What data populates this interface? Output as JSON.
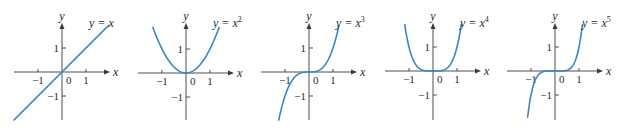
{
  "colors": {
    "curve": "#3d84c6",
    "axis": "#3a3a3a"
  },
  "chart_data": [
    {
      "type": "line",
      "title": "",
      "function": "y = x",
      "exponent": 1,
      "label_base": "y = x",
      "label_sup": "",
      "xlabel": "x",
      "ylabel": "y",
      "x_ticks": [
        "-1",
        "0",
        "1"
      ],
      "y_ticks": [
        "1",
        "-1"
      ],
      "xlim": [
        -2.0,
        2.0
      ],
      "ylim": [
        -2.0,
        2.0
      ],
      "curve_x_range": [
        -2.0,
        1.95
      ],
      "grid": false
    },
    {
      "type": "line",
      "title": "",
      "function": "y = x^2",
      "exponent": 2,
      "label_base": "y = x",
      "label_sup": "2",
      "xlabel": "x",
      "ylabel": "y",
      "x_ticks": [
        "-1",
        "0",
        "1"
      ],
      "y_ticks": [
        "1",
        "-1"
      ],
      "xlim": [
        -1.9,
        1.9
      ],
      "ylim": [
        -2.0,
        2.0
      ],
      "curve_x_range": [
        -1.38,
        1.38
      ],
      "grid": false
    },
    {
      "type": "line",
      "title": "",
      "function": "y = x^3",
      "exponent": 3,
      "label_base": "y = x",
      "label_sup": "3",
      "xlabel": "x",
      "ylabel": "y",
      "x_ticks": [
        "-1",
        "0",
        "1"
      ],
      "y_ticks": [
        "1",
        "-1"
      ],
      "xlim": [
        -1.9,
        1.9
      ],
      "ylim": [
        -2.0,
        2.0
      ],
      "curve_x_range": [
        -1.26,
        1.24
      ],
      "grid": false
    },
    {
      "type": "line",
      "title": "",
      "function": "y = x^4",
      "exponent": 4,
      "label_base": "y = x",
      "label_sup": "4",
      "xlabel": "x",
      "ylabel": "y",
      "x_ticks": [
        "-1",
        "0",
        "1"
      ],
      "y_ticks": [
        "1",
        "-1"
      ],
      "xlim": [
        -1.9,
        1.9
      ],
      "ylim": [
        -2.0,
        2.0
      ],
      "curve_x_range": [
        -1.18,
        1.18
      ],
      "grid": false
    },
    {
      "type": "line",
      "title": "",
      "function": "y = x^5",
      "exponent": 5,
      "label_base": "y = x",
      "label_sup": "5",
      "xlabel": "x",
      "ylabel": "y",
      "x_ticks": [
        "-1",
        "0",
        "1"
      ],
      "y_ticks": [
        "1",
        "-1"
      ],
      "xlim": [
        -1.9,
        1.9
      ],
      "ylim": [
        -2.0,
        2.0
      ],
      "curve_x_range": [
        -1.14,
        1.14
      ],
      "grid": false
    }
  ],
  "layout": {
    "unit_px": 24,
    "origins": [
      [
        62,
        72
      ],
      [
        186,
        73
      ],
      [
        309,
        72
      ],
      [
        433,
        71
      ],
      [
        555,
        71
      ]
    ],
    "x_axis_extent": [
      [
        -2.0,
        2.0
      ],
      [
        -2.0,
        2.0
      ],
      [
        -2.0,
        2.0
      ],
      [
        -2.0,
        2.0
      ],
      [
        -2.0,
        2.0
      ]
    ],
    "y_axis_top": 23,
    "y_axis_bottom": 120
  }
}
